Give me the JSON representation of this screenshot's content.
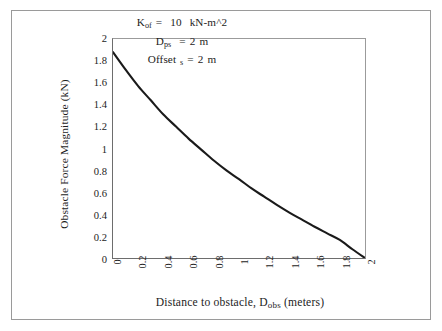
{
  "chart_data": {
    "type": "line",
    "title": "",
    "xlabel": "Distance to obstacle, Dobs (meters)",
    "xlabel_main": "Distance to obstacle, D",
    "xlabel_sub": "obs",
    "xlabel_tail": " (meters)",
    "ylabel": "Obstacle Force Magnitude  (kN)",
    "xlim": [
      0,
      2
    ],
    "ylim": [
      0,
      2
    ],
    "grid": false,
    "legend": "none",
    "xticks": [
      "0",
      "0.2",
      "0.4",
      "0.6",
      "0.8",
      "1",
      "1.2",
      "1.4",
      "1.6",
      "1.8",
      "2"
    ],
    "yticks": [
      "0",
      "0.2",
      "0.4",
      "0.6",
      "0.8",
      "1",
      "1.2",
      "1.4",
      "1.6",
      "1.8",
      "2"
    ],
    "xtick_values": [
      0,
      0.2,
      0.4,
      0.6,
      0.8,
      1,
      1.2,
      1.4,
      1.6,
      1.8,
      2
    ],
    "ytick_values": [
      0,
      0.2,
      0.4,
      0.6,
      0.8,
      1,
      1.2,
      1.4,
      1.6,
      1.8,
      2
    ],
    "series": [
      {
        "name": "Obstacle force magnitude",
        "color": "#1a1a1a",
        "x": [
          0,
          0.1,
          0.2,
          0.3,
          0.4,
          0.5,
          0.6,
          0.7,
          0.8,
          0.9,
          1.0,
          1.1,
          1.2,
          1.3,
          1.4,
          1.5,
          1.6,
          1.7,
          1.8,
          1.9,
          2.0
        ],
        "y": [
          1.88,
          1.72,
          1.57,
          1.44,
          1.31,
          1.2,
          1.09,
          0.99,
          0.89,
          0.8,
          0.72,
          0.635,
          0.56,
          0.485,
          0.415,
          0.35,
          0.285,
          0.225,
          0.165,
          0.08,
          0.0
        ]
      }
    ],
    "annotations": [
      {
        "id": "kof",
        "label": "Kof",
        "label_main": "K",
        "label_sub": "of",
        "equals": "=",
        "value": "10",
        "units": "kN-m^2"
      },
      {
        "id": "dps",
        "label": "Dps",
        "label_main": "D",
        "label_sub": "ps",
        "equals": "=",
        "value": "2",
        "units": "m"
      },
      {
        "id": "offset",
        "label": "Offset s",
        "label_main": "Offset",
        "label_sub": "s",
        "equals": "=",
        "value": "2",
        "units": "m"
      }
    ],
    "colors": {
      "curve": "#1a1a1a",
      "axis": "#6d6d6d",
      "frame": "#9a9a9a",
      "background": "#ffffff",
      "text": "#1c1c1c"
    }
  }
}
